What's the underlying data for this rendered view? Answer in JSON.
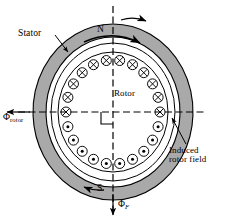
{
  "figure": {
    "type": "cross-section-diagram",
    "background_color": "#ffffff",
    "line_color": "#000000",
    "stator_fill": "#a9a9a9",
    "rotor_fill": "#ffffff",
    "conductor_fill": "#ffffff"
  },
  "labels": {
    "stator": "Stator",
    "rotor": "Rotor",
    "north_pole": "N",
    "south_pole": "S",
    "phi_rotor_symbol": "Φ",
    "phi_rotor_subscript": "rotor",
    "phi_field_symbol": "Φ",
    "phi_field_subscript": "F",
    "induced_line1": "Induced",
    "induced_line2": "rotor field"
  },
  "geometry": {
    "center_x": 113,
    "center_y": 112,
    "stator_outer_rx": 80,
    "stator_outer_ry": 88,
    "stator_inner_rx": 67,
    "stator_inner_ry": 75,
    "airgap_rx": 62,
    "airgap_ry": 69,
    "rotor_rx": 55,
    "rotor_ry": 60,
    "conductor_ring_rx": 47,
    "conductor_ring_ry": 52,
    "conductor_radius": 5.0
  },
  "conductors": {
    "total_count": 22,
    "top_half_symbol": "cross",
    "top_half_count": 11,
    "bottom_half_symbol": "dot",
    "bottom_half_count": 11,
    "top_half_meaning": "current into page",
    "bottom_half_meaning": "current out of page",
    "angles_deg": [
      0,
      16.36,
      32.73,
      49.09,
      65.45,
      81.82,
      98.18,
      114.55,
      130.91,
      147.27,
      163.64,
      180,
      196.36,
      212.73,
      229.09,
      245.45,
      261.82,
      278.18,
      294.55,
      310.91,
      327.27,
      343.64
    ]
  },
  "axes": {
    "vertical_dashed": true,
    "horizontal_dashed": true,
    "vertical_top_y": 6,
    "vertical_bottom_y": 214,
    "horizontal_left_x": 6,
    "horizontal_right_x": 207,
    "right_angle_marker": true
  },
  "arrows": {
    "rotation_outer": "clockwise",
    "rotation_inner": "clockwise",
    "phi_rotor_direction": "left",
    "phi_field_direction": "down",
    "bottom_arrow_direction": "left",
    "top_arrow_direction": "right"
  },
  "leaders": {
    "stator_leader": "from Stator label to stator annulus upper-left",
    "induced_leader": "from Induced rotor field label to horizontal axis right side"
  }
}
